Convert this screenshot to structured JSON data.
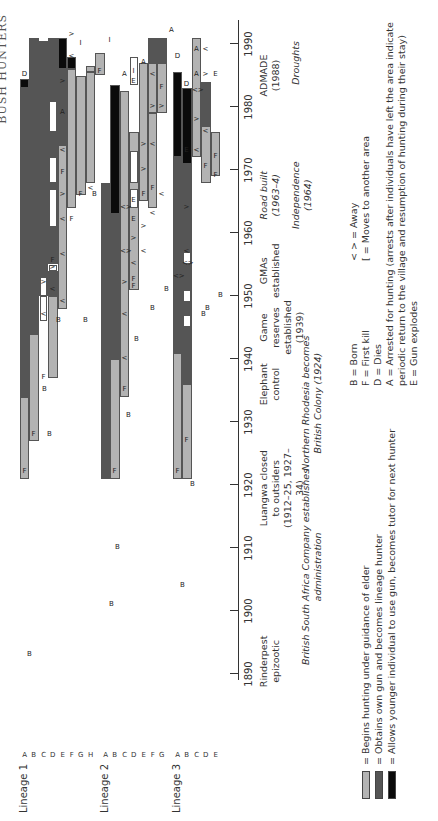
{
  "page_header": "BUSH HUNTERS",
  "chart_data": {
    "type": "timeline",
    "xlabel": "Year",
    "x_range": [
      1890,
      1990
    ],
    "ticks": [
      "1890",
      "1900",
      "1910",
      "1920",
      "1930",
      "1940",
      "1950",
      "1960",
      "1970",
      "1980",
      "1990"
    ],
    "lineages": [
      {
        "name": "Lineage 1",
        "rows": [
          "A",
          "B",
          "C",
          "D",
          "E",
          "F",
          "G",
          "H"
        ]
      },
      {
        "name": "Lineage 2",
        "rows": [
          "A",
          "B",
          "C",
          "D",
          "E",
          "F",
          "G"
        ]
      },
      {
        "name": "Lineage 3",
        "rows": [
          "A",
          "B",
          "C",
          "D",
          "E"
        ]
      }
    ],
    "legend": [
      {
        "key": "light",
        "color": "#b3b3b3",
        "label": "= Begins hunting under guidance of elder"
      },
      {
        "key": "dark",
        "color": "#555555",
        "label": "= Obtains own gun and becomes lineage hunter"
      },
      {
        "key": "black",
        "color": "#0a0a0a",
        "label": "= Allows younger individual to use gun, becomes tutor for next hunter"
      }
    ],
    "symbol_key": [
      "B = Born",
      "F = First kill",
      "D = Dies",
      "A = Arrested for hunting (arrests after individuals have left the area indicate",
      "      periodic return to the village and resumption of hunting during their stay)",
      "E = Gun explodes"
    ],
    "symbol_key_right": [
      "< > = Away",
      "[    = Moves to another area"
    ],
    "events_row1": [
      {
        "year": 1892,
        "text": "Rinderpest epizootic",
        "italic": false
      },
      {
        "year": 1919.5,
        "text": "Luangwa closed\nto outsiders\n(1912–25, 1927–34)",
        "italic": false
      },
      {
        "year": 1936,
        "text": "Elephant\ncontrol",
        "italic": false
      },
      {
        "year": 1945,
        "text": "Game\nreserves\nestablished\n(1939)",
        "italic": false
      },
      {
        "year": 1954,
        "text": "GMAs\nestablished",
        "italic": false
      },
      {
        "year": 1966,
        "text": "Road built\n(1963–4)",
        "italic": true
      },
      {
        "year": 1966,
        "text": "Independence\n(1964)",
        "italic": true,
        "second": true
      },
      {
        "year": 1985,
        "text": "ADMADE\n(1988)",
        "italic": false
      },
      {
        "year": 1987,
        "text": "Droughts",
        "italic": true,
        "low": true
      }
    ],
    "events_row2": [
      {
        "year": 1907,
        "text": "British South Africa Company establishes\nadministration",
        "italic": true
      },
      {
        "year": 1933,
        "text": "Northern Rhodesia becomes\nBritish Colony (1924)",
        "italic": true
      }
    ],
    "segments": [
      {
        "l": 0,
        "r": 0,
        "from": 1921,
        "to": 1934,
        "c": "light"
      },
      {
        "l": 0,
        "r": 0,
        "from": 1934,
        "to": 1983,
        "c": "dark"
      },
      {
        "l": 0,
        "r": 0,
        "from": 1983,
        "to": 1984.5,
        "c": "black"
      },
      {
        "l": 0,
        "r": 1,
        "from": 1927,
        "to": 1944,
        "c": "light"
      },
      {
        "l": 0,
        "r": 1,
        "from": 1944,
        "to": 1991,
        "c": "dark"
      },
      {
        "l": 0,
        "r": 2,
        "from": 1950,
        "to": 1990.5,
        "c": "dark"
      },
      {
        "l": 0,
        "r": 3,
        "from": 1937,
        "to": 1950,
        "c": "light"
      },
      {
        "l": 0,
        "r": 3,
        "from": 1950,
        "to": 1954,
        "c": "dark"
      },
      {
        "l": 0,
        "r": 3,
        "from": 1955,
        "to": 1959,
        "c": "dark"
      },
      {
        "l": 0,
        "r": 3,
        "from": 1959,
        "to": 1984,
        "c": "dark"
      },
      {
        "l": 0,
        "r": 3,
        "from": 1984,
        "to": 1991,
        "c": "dark"
      },
      {
        "l": 0,
        "r": 4,
        "from": 1948,
        "to": 1974,
        "c": "light"
      },
      {
        "l": 0,
        "r": 4,
        "from": 1974,
        "to": 1986,
        "c": "dark"
      },
      {
        "l": 0,
        "r": 4,
        "from": 1986,
        "to": 1991,
        "c": "black"
      },
      {
        "l": 0,
        "r": 5,
        "from": 1964,
        "to": 1986,
        "c": "light"
      },
      {
        "l": 0,
        "r": 5,
        "from": 1986,
        "to": 1988,
        "c": "black"
      },
      {
        "l": 0,
        "r": 6,
        "from": 1966,
        "to": 1985,
        "c": "light"
      },
      {
        "l": 0,
        "r": 7,
        "from": 1968,
        "to": 1985.5,
        "c": "light"
      },
      {
        "l": 0,
        "r": 7,
        "from": 1985.5,
        "to": 1986.5,
        "c": "light"
      },
      {
        "l": 0,
        "r": 8,
        "from": 1985,
        "to": 1988.5,
        "c": "light"
      },
      {
        "l": 1,
        "r": 0,
        "from": 1921,
        "to": 1968,
        "c": "dark"
      },
      {
        "l": 1,
        "r": 1,
        "from": 1921,
        "to": 1940,
        "c": "light"
      },
      {
        "l": 1,
        "r": 1,
        "from": 1940,
        "to": 1963,
        "c": "dark"
      },
      {
        "l": 1,
        "r": 1,
        "from": 1963,
        "to": 1983.5,
        "c": "black"
      },
      {
        "l": 1,
        "r": 2,
        "from": 1934,
        "to": 1982.5,
        "c": "light"
      },
      {
        "l": 1,
        "r": 3,
        "from": 1951,
        "to": 1976,
        "c": "light"
      },
      {
        "l": 1,
        "r": 4,
        "from": 1965,
        "to": 1987,
        "c": "light"
      },
      {
        "l": 1,
        "r": 5,
        "from": 1964,
        "to": 1979,
        "c": "light"
      },
      {
        "l": 1,
        "r": 5,
        "from": 1979,
        "to": 1987,
        "c": "light"
      },
      {
        "l": 1,
        "r": 5,
        "from": 1987,
        "to": 1991,
        "c": "dark"
      },
      {
        "l": 1,
        "r": 6,
        "from": 1979,
        "to": 1987,
        "c": "light"
      },
      {
        "l": 1,
        "r": 6,
        "from": 1987,
        "to": 1991,
        "c": "dark"
      },
      {
        "l": 2,
        "r": 0,
        "from": 1921,
        "to": 1941,
        "c": "light"
      },
      {
        "l": 2,
        "r": 0,
        "from": 1941,
        "to": 1972,
        "c": "dark"
      },
      {
        "l": 2,
        "r": 0,
        "from": 1972,
        "to": 1985.5,
        "c": "black"
      },
      {
        "l": 2,
        "r": 1,
        "from": 1921,
        "to": 1936,
        "c": "light"
      },
      {
        "l": 2,
        "r": 1,
        "from": 1936,
        "to": 1971,
        "c": "dark"
      },
      {
        "l": 2,
        "r": 1,
        "from": 1971,
        "to": 1983,
        "c": "black"
      },
      {
        "l": 2,
        "r": 2,
        "from": 1972,
        "to": 1991,
        "c": "light"
      },
      {
        "l": 2,
        "r": 3,
        "from": 1968,
        "to": 1977,
        "c": "light"
      },
      {
        "l": 2,
        "r": 3,
        "from": 1977,
        "to": 1984,
        "c": "dark"
      },
      {
        "l": 2,
        "r": 4,
        "from": 1969,
        "to": 1976,
        "c": "light"
      }
    ],
    "away_blocks": [
      {
        "l": 0,
        "r": 2,
        "from": 1946,
        "to": 1950
      },
      {
        "l": 0,
        "r": 2,
        "from": 1950,
        "to": 1953
      },
      {
        "l": 0,
        "r": 3,
        "from": 1954,
        "to": 1955
      },
      {
        "l": 0,
        "r": 3,
        "from": 1961,
        "to": 1967
      },
      {
        "l": 0,
        "r": 3,
        "from": 1968,
        "to": 1972
      },
      {
        "l": 0,
        "r": 3,
        "from": 1976,
        "to": 1981
      },
      {
        "l": 1,
        "r": 3,
        "from": 1964,
        "to": 1967
      },
      {
        "l": 1,
        "r": 3,
        "from": 1968,
        "to": 1973
      },
      {
        "l": 1,
        "r": 3,
        "from": 1983.5,
        "to": 1988
      },
      {
        "l": 2,
        "r": 1,
        "from": 1945,
        "to": 1947
      },
      {
        "l": 2,
        "r": 1,
        "from": 1949,
        "to": 1951
      },
      {
        "l": 2,
        "r": 1,
        "from": 1955,
        "to": 1957
      }
    ],
    "markers": [
      {
        "l": 0,
        "r": 0,
        "year": 1922,
        "t": "F"
      },
      {
        "l": 0,
        "r": 0,
        "year": 1985,
        "t": "D",
        "outside": true
      },
      {
        "l": 0,
        "r": 1,
        "year": 1928,
        "t": "F"
      },
      {
        "l": 0,
        "r": 2,
        "year": 1937,
        "t": "F"
      },
      {
        "l": 0,
        "r": 2,
        "year": 1947,
        "t": "<"
      },
      {
        "l": 0,
        "r": 2,
        "year": 1952,
        "t": ">"
      },
      {
        "l": 0,
        "r": 3,
        "year": 1951,
        "t": "<"
      },
      {
        "l": 0,
        "r": 3,
        "year": 1954.5,
        "t": ">"
      },
      {
        "l": 0,
        "r": 3,
        "year": 1955.5,
        "t": "F"
      },
      {
        "l": 0,
        "r": 4,
        "year": 1949,
        "t": "<"
      },
      {
        "l": 0,
        "r": 4,
        "year": 1956.5,
        "t": "<"
      },
      {
        "l": 0,
        "r": 4,
        "year": 1962,
        "t": "<"
      },
      {
        "l": 0,
        "r": 4,
        "year": 1966,
        "t": ">"
      },
      {
        "l": 0,
        "r": 4,
        "year": 1969.5,
        "t": "F"
      },
      {
        "l": 0,
        "r": 4,
        "year": 1973,
        "t": "<"
      },
      {
        "l": 0,
        "r": 4,
        "year": 1979,
        "t": "A"
      },
      {
        "l": 0,
        "r": 4,
        "year": 1984,
        "t": ">"
      },
      {
        "l": 0,
        "r": 5,
        "year": 1962,
        "t": "F"
      },
      {
        "l": 0,
        "r": 5,
        "year": 1988,
        "t": "<"
      },
      {
        "l": 0,
        "r": 6,
        "year": 1966,
        "t": "F"
      },
      {
        "l": 0,
        "r": 6,
        "year": 1990,
        "t": "I"
      },
      {
        "l": 0,
        "r": 7,
        "year": 1967,
        "t": "<"
      },
      {
        "l": 0,
        "r": 8,
        "year": 1985.5,
        "t": "F"
      },
      {
        "l": 0,
        "r": 9,
        "year": 1990.5,
        "t": "I"
      },
      {
        "l": 0,
        "r": 5,
        "year": 1991.5,
        "t": ">"
      },
      {
        "l": 1,
        "r": 1,
        "year": 1922,
        "t": "F"
      },
      {
        "l": 1,
        "r": 2,
        "year": 1935,
        "t": "F"
      },
      {
        "l": 1,
        "r": 2,
        "year": 1940,
        "t": "<"
      },
      {
        "l": 1,
        "r": 2,
        "year": 1947,
        "t": "<"
      },
      {
        "l": 1,
        "r": 2,
        "year": 1952,
        "t": ">"
      },
      {
        "l": 1,
        "r": 2,
        "year": 1957,
        "t": "<>"
      },
      {
        "l": 1,
        "r": 2,
        "year": 1964,
        "t": "<>"
      },
      {
        "l": 1,
        "r": 2,
        "year": 1985,
        "t": "A",
        "outside": true
      },
      {
        "l": 1,
        "r": 3,
        "year": 1951.5,
        "t": "F"
      },
      {
        "l": 1,
        "r": 3,
        "year": 1952.5,
        "t": "F"
      },
      {
        "l": 1,
        "r": 3,
        "year": 1955,
        "t": "<"
      },
      {
        "l": 1,
        "r": 3,
        "year": 1959,
        "t": ">"
      },
      {
        "l": 1,
        "r": 3,
        "year": 1962,
        "t": "E"
      },
      {
        "l": 1,
        "r": 3,
        "year": 1965,
        "t": "E"
      },
      {
        "l": 1,
        "r": 3,
        "year": 1984,
        "t": "E"
      },
      {
        "l": 1,
        "r": 3,
        "year": 1985.5,
        "t": "I",
        "outside": true
      },
      {
        "l": 1,
        "r": 4,
        "year": 1957,
        "t": "<"
      },
      {
        "l": 1,
        "r": 4,
        "year": 1961,
        "t": ">"
      },
      {
        "l": 1,
        "r": 4,
        "year": 1966,
        "t": "F"
      },
      {
        "l": 1,
        "r": 4,
        "year": 1970,
        "t": ">"
      },
      {
        "l": 1,
        "r": 4,
        "year": 1974,
        "t": ">"
      },
      {
        "l": 1,
        "r": 4,
        "year": 1987,
        "t": "A",
        "outside": true
      },
      {
        "l": 1,
        "r": 5,
        "year": 1963,
        "t": "<"
      },
      {
        "l": 1,
        "r": 5,
        "year": 1967,
        "t": "F"
      },
      {
        "l": 1,
        "r": 5,
        "year": 1974,
        "t": "<"
      },
      {
        "l": 1,
        "r": 5,
        "year": 1980,
        "t": ">"
      },
      {
        "l": 1,
        "r": 5,
        "year": 1985,
        "t": "<"
      },
      {
        "l": 1,
        "r": 6,
        "year": 1966,
        "t": "<"
      },
      {
        "l": 1,
        "r": 6,
        "year": 1983,
        "t": "F"
      },
      {
        "l": 1,
        "r": 6,
        "year": 1980,
        "t": ">"
      },
      {
        "l": 1,
        "r": 7,
        "year": 1992,
        "t": "A"
      },
      {
        "l": 2,
        "r": 0,
        "year": 1922,
        "t": "F"
      },
      {
        "l": 2,
        "r": 0,
        "year": 1953,
        "t": "<>"
      },
      {
        "l": 2,
        "r": 1,
        "year": 1927,
        "t": "F"
      },
      {
        "l": 2,
        "r": 1,
        "year": 1955,
        "t": "<>"
      },
      {
        "l": 2,
        "r": 1,
        "year": 1957,
        "t": "<"
      },
      {
        "l": 2,
        "r": 1,
        "year": 1964,
        "t": ">"
      },
      {
        "l": 2,
        "r": 1,
        "year": 1973,
        "t": "E"
      },
      {
        "l": 2,
        "r": 0,
        "year": 1988,
        "t": "D",
        "outside": true
      },
      {
        "l": 2,
        "r": 2,
        "year": 1973,
        "t": "<"
      },
      {
        "l": 2,
        "r": 2,
        "year": 1978,
        "t": ">"
      },
      {
        "l": 2,
        "r": 2,
        "year": 1982.5,
        "t": "<>"
      },
      {
        "l": 2,
        "r": 2,
        "year": 1985,
        "t": "A"
      },
      {
        "l": 2,
        "r": 2,
        "year": 1989,
        "t": "A"
      },
      {
        "l": 2,
        "r": 1,
        "year": 1983.5,
        "t": "D"
      },
      {
        "l": 2,
        "r": 3,
        "year": 1970.5,
        "t": "F"
      },
      {
        "l": 2,
        "r": 3,
        "year": 1976,
        "t": "<"
      },
      {
        "l": 2,
        "r": 3,
        "year": 1985,
        "t": ">"
      },
      {
        "l": 2,
        "r": 3,
        "year": 1989,
        "t": "<"
      },
      {
        "l": 2,
        "r": 4,
        "year": 1969,
        "t": "F"
      },
      {
        "l": 2,
        "r": 4,
        "year": 1972,
        "t": "F"
      },
      {
        "l": 2,
        "r": 4,
        "year": 1985,
        "t": "E"
      }
    ],
    "births": [
      {
        "x": 1893,
        "y": 25
      },
      {
        "x": 1928,
        "y": 45
      },
      {
        "x": 1935,
        "y": 40
      },
      {
        "x": 1946,
        "y": 54
      },
      {
        "x": 1946,
        "y": 81
      },
      {
        "x": 1966,
        "y": 90
      },
      {
        "x": 1910,
        "y": 113
      },
      {
        "x": 1901,
        "y": 107
      },
      {
        "x": 1931,
        "y": 124
      },
      {
        "x": 1951,
        "y": 162
      },
      {
        "x": 1948,
        "y": 148
      },
      {
        "x": 1943,
        "y": 132
      },
      {
        "x": 1920,
        "y": 188
      },
      {
        "x": 1904,
        "y": 178
      },
      {
        "x": 1948,
        "y": 203
      },
      {
        "x": 1947,
        "y": 199
      },
      {
        "x": 1950,
        "y": 216
      }
    ]
  }
}
